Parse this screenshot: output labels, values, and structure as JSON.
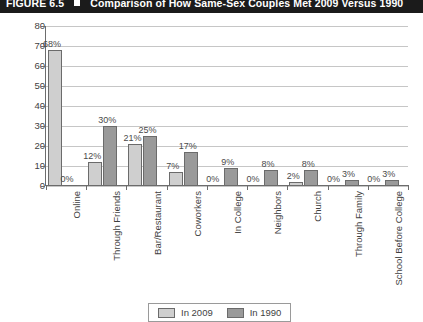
{
  "figure": {
    "label": "FIGURE 6.5",
    "marker": "square-bullet",
    "caption": "Comparison of How Same-Sex Couples Met 2009 Versus 1990"
  },
  "legend": {
    "position": "bottom-center",
    "entries": [
      {
        "name": "In 2009",
        "color": "#cfcfcf"
      },
      {
        "name": "In 1990",
        "color": "#9a9a9a"
      }
    ]
  },
  "axes": {
    "y_ticks": [
      "0",
      "10",
      "20",
      "30",
      "40",
      "50",
      "60",
      "70",
      "80"
    ],
    "x_categories": [
      "Online",
      "Through Friends",
      "Bar/Restaurant",
      "Coworkers",
      "In College",
      "Neighbors",
      "Church",
      "Through Family",
      "School Before College"
    ]
  },
  "chart_data": {
    "type": "bar",
    "title": "Comparison of How Same-Sex Couples Met 2009 Versus 1990",
    "xlabel": "",
    "ylabel": "",
    "ylim": [
      0,
      80
    ],
    "ytick_step": 10,
    "grid": true,
    "legend_position": "bottom-center",
    "categories": [
      "Online",
      "Through Friends",
      "Bar/Restaurant",
      "Coworkers",
      "In College",
      "Neighbors",
      "Church",
      "Through Family",
      "School Before College"
    ],
    "series": [
      {
        "name": "In 2009",
        "color": "#cfcfcf",
        "values": [
          68,
          12,
          21,
          7,
          0,
          0,
          2,
          0,
          0
        ],
        "labels": [
          "68%",
          "12%",
          "21%",
          "7%",
          "0%",
          "0%",
          "2%",
          "0%",
          "0%"
        ]
      },
      {
        "name": "In 1990",
        "color": "#9a9a9a",
        "values": [
          0,
          30,
          25,
          17,
          9,
          8,
          8,
          3,
          3
        ],
        "labels": [
          "0%",
          "30%",
          "25%",
          "17%",
          "9%",
          "8%",
          "8%",
          "3%",
          "3%"
        ]
      }
    ]
  }
}
